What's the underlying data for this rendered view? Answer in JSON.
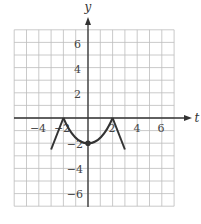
{
  "chart_data": {
    "type": "line",
    "title": "",
    "xlabel": "t",
    "ylabel": "y",
    "xlim": [
      -6,
      7
    ],
    "ylim": [
      -7,
      7
    ],
    "grid": true,
    "grid_step": 1,
    "x_ticks": [
      -4,
      -2,
      2,
      4,
      6
    ],
    "y_ticks": [
      -6,
      -4,
      -2,
      2,
      4,
      6
    ],
    "x_tick_labels": [
      "−4",
      "−2",
      "2",
      "4",
      "6"
    ],
    "y_tick_labels": [
      "−6",
      "−4",
      "−2",
      "2",
      "4",
      "6"
    ],
    "series": [
      {
        "name": "curve",
        "segments": [
          {
            "kind": "line",
            "points": [
              [
                -3,
                -2.5
              ],
              [
                -2,
                0
              ]
            ]
          },
          {
            "kind": "curve",
            "points": [
              [
                -2,
                0
              ],
              [
                -1,
                -1.5
              ],
              [
                0,
                -2
              ],
              [
                1,
                -1.5
              ],
              [
                2,
                0
              ]
            ]
          },
          {
            "kind": "line",
            "points": [
              [
                2,
                0
              ],
              [
                3,
                -2.5
              ]
            ]
          }
        ],
        "marked_points": [
          [
            0,
            -2
          ]
        ],
        "color": "#333333"
      }
    ],
    "legend": null
  },
  "axes": {
    "x_label": "t",
    "y_label": "y",
    "x_tick_labels": [
      "−4",
      "−2",
      "2",
      "4",
      "6"
    ],
    "y_tick_labels_pos": [
      "6",
      "4",
      "2"
    ],
    "y_tick_labels_neg": [
      "−2",
      "−4",
      "−6"
    ]
  }
}
